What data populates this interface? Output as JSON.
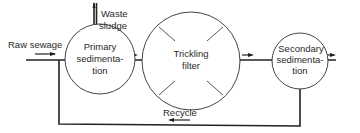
{
  "diagram": {
    "inputs": {
      "raw_sewage": "Raw sewage"
    },
    "outputs": {
      "waste_sludge_line1": "Waste",
      "waste_sludge_line2": "sludge"
    },
    "nodes": [
      {
        "id": "primary",
        "lines": [
          "Primary",
          "sedimenta-",
          "tion"
        ]
      },
      {
        "id": "filter",
        "lines": [
          "Trickling",
          "filter"
        ]
      },
      {
        "id": "secondary",
        "lines": [
          "Secondary",
          "sedimenta-",
          "tion"
        ]
      }
    ],
    "recycle_label": "Recycle",
    "colors": {
      "line": "#222222",
      "text": "#2a2a2a",
      "background": "#ffffff"
    }
  }
}
